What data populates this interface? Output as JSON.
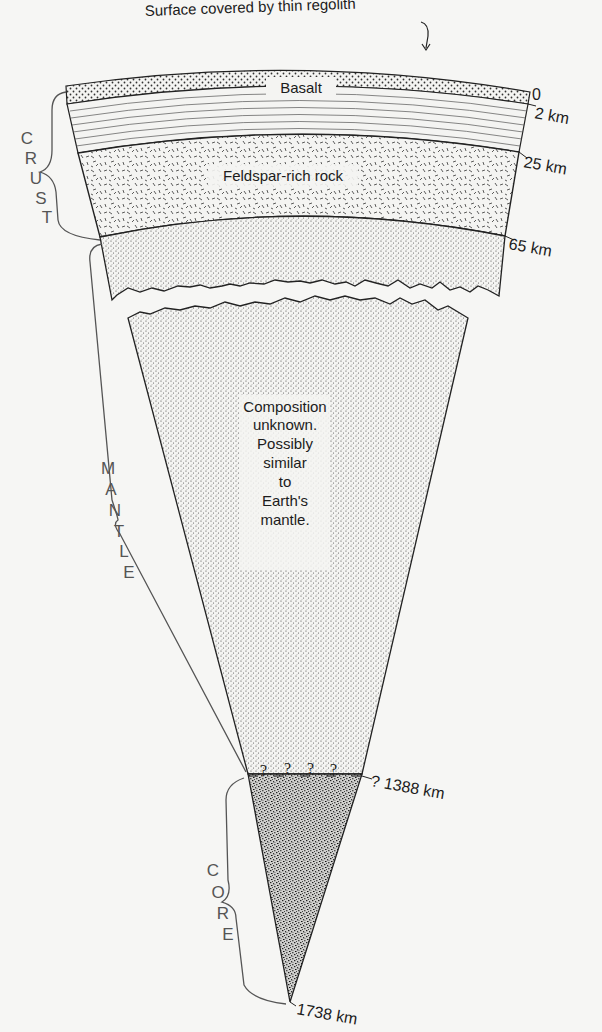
{
  "diagram": {
    "annotations": {
      "surface": "Surface covered by thin regolith"
    },
    "layers": [
      {
        "id": "regolith",
        "label": "",
        "top_km": "0",
        "pattern": "coarse-dots"
      },
      {
        "id": "basalt",
        "label": "Basalt",
        "top_km": "2 km",
        "pattern": "horizontal-lines"
      },
      {
        "id": "feldspar",
        "label": "Feldspar-rich rock",
        "top_km": "25 km",
        "pattern": "dashes"
      },
      {
        "id": "upper-mantle",
        "label": "",
        "top_km": "65 km",
        "pattern": "fine-dots"
      },
      {
        "id": "mantle",
        "label_lines": [
          "Composition",
          "unknown.",
          "Possibly",
          "similar",
          "to",
          "Earth's",
          "mantle."
        ],
        "pattern": "fine-dots"
      },
      {
        "id": "core",
        "label": "",
        "top_km": "1388 km",
        "pattern": "dense-speckle"
      }
    ],
    "depth_labels": [
      "0",
      "2 km",
      "25 km",
      "65 km",
      "? 1388 km",
      "1738 km"
    ],
    "boundary_uncertainty_marks": [
      "?",
      "?",
      "?",
      "?"
    ],
    "zones": [
      {
        "name": "crust",
        "letters": [
          "C",
          "R",
          "U",
          "S",
          "T"
        ]
      },
      {
        "name": "mantle",
        "letters": [
          "M",
          "A",
          "N",
          "T",
          "L",
          "E"
        ]
      },
      {
        "name": "core",
        "letters": [
          "C",
          "O",
          "R",
          "E"
        ]
      }
    ]
  }
}
